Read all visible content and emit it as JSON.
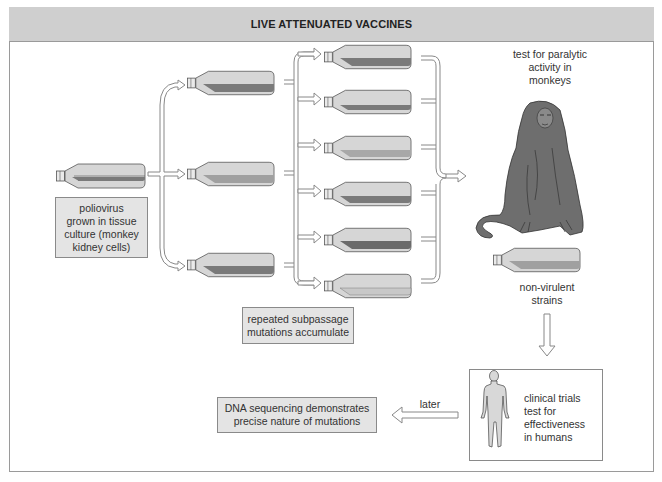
{
  "title": "LIVE ATTENUATED VACCINES",
  "start_box": {
    "lines": [
      "poliovirus",
      "grown in tissue",
      "culture (monkey",
      "kidney cells)"
    ]
  },
  "subpassage_box": {
    "lines": [
      "repeated subpassage",
      "mutations accumulate"
    ]
  },
  "monkey_test": {
    "lines": [
      "test for paralytic",
      "activity in",
      "monkeys"
    ]
  },
  "nonvirulent": {
    "lines": [
      "non-virulent",
      "strains"
    ]
  },
  "clinical_box": {
    "lines": [
      "clinical trials",
      "test for",
      "effectiveness",
      "in humans"
    ]
  },
  "later_label": "later",
  "dna_box": {
    "lines": [
      "DNA sequencing demonstrates",
      "precise nature of mutations"
    ]
  },
  "colors": {
    "header_bg": "#cfcfcf",
    "box_bg": "#e4e4e4",
    "flask_light": "#d6d6d6",
    "flask_dark": "#7a7a7a",
    "flask_medium": "#a8a8a8",
    "monkey": "#6e6e6e"
  }
}
